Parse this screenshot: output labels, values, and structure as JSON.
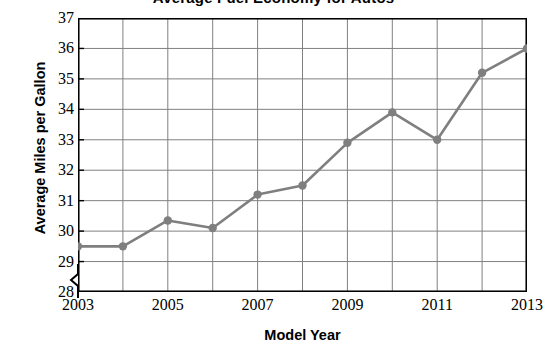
{
  "chart_data": {
    "type": "line",
    "title": "Average Fuel Economy for Autos",
    "title_note": "cropped-at-top-edge",
    "xlabel": "Model Year",
    "ylabel": "Average Miles per Gallon",
    "x": [
      2003,
      2004,
      2005,
      2006,
      2007,
      2008,
      2009,
      2010,
      2011,
      2012,
      2013
    ],
    "values": [
      29.5,
      29.5,
      30.35,
      30.1,
      31.2,
      31.5,
      32.9,
      33.9,
      33.0,
      35.2,
      36.0
    ],
    "series": [
      {
        "name": "Average Miles per Gallon",
        "values": [
          29.5,
          29.5,
          30.35,
          30.1,
          31.2,
          31.5,
          32.9,
          33.9,
          33.0,
          35.2,
          36.0
        ]
      }
    ],
    "xlim": [
      2003,
      2013
    ],
    "ylim": [
      28,
      37
    ],
    "y_ticks": [
      28,
      29,
      30,
      31,
      32,
      33,
      34,
      35,
      36,
      37
    ],
    "x_ticks": [
      2003,
      2004,
      2005,
      2006,
      2007,
      2008,
      2009,
      2010,
      2011,
      2012,
      2013
    ],
    "x_tick_labels_shown": [
      2003,
      2005,
      2007,
      2009,
      2011,
      2013
    ],
    "grid": true,
    "legend": "none",
    "y_axis_break": true,
    "marker": "circle",
    "line_color": "#7f7f7f",
    "marker_color": "#7f7f7f",
    "grid_color": "#808080",
    "axis_color": "#000000",
    "background_color": "#ffffff"
  },
  "axes": {
    "y_tick_labels": [
      "37",
      "36",
      "35",
      "34",
      "33",
      "32",
      "31",
      "30",
      "29",
      "28"
    ],
    "x_tick_labels": [
      "2003",
      "2005",
      "2007",
      "2009",
      "2011",
      "2013"
    ]
  }
}
